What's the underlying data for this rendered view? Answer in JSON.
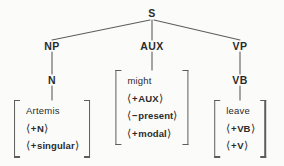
{
  "figure": {
    "type": "syntax-tree",
    "title": "",
    "background_color": "#fbfbfa",
    "line_color": "#5d5d5d",
    "text_color": "#2b2b2b"
  },
  "tree": {
    "root": {
      "label": "S",
      "x": 152,
      "y": 13
    },
    "level2": [
      {
        "label": "NP",
        "x": 52,
        "y": 46
      },
      {
        "label": "AUX",
        "x": 152,
        "y": 46
      },
      {
        "label": "VP",
        "x": 240,
        "y": 46
      }
    ],
    "level3": [
      {
        "label": "N",
        "x": 52,
        "y": 80
      },
      {
        "label": "VB",
        "x": 240,
        "y": 80
      }
    ]
  },
  "matrices": [
    {
      "id": "np-matrix",
      "parent": "N",
      "x": 52,
      "y": 100,
      "rows": [
        {
          "kind": "word",
          "text": "Artemis"
        },
        {
          "kind": "feature",
          "sign": "+",
          "feature": "N"
        },
        {
          "kind": "feature",
          "sign": "+",
          "feature": "singular"
        }
      ]
    },
    {
      "id": "aux-matrix",
      "parent": "AUX",
      "x": 152,
      "y": 70,
      "rows": [
        {
          "kind": "word",
          "text": "might"
        },
        {
          "kind": "feature",
          "sign": "+",
          "feature": "AUX"
        },
        {
          "kind": "feature",
          "sign": "−",
          "feature": "present"
        },
        {
          "kind": "feature",
          "sign": "+",
          "feature": "modal"
        }
      ]
    },
    {
      "id": "vp-matrix",
      "parent": "VB",
      "x": 240,
      "y": 100,
      "rows": [
        {
          "kind": "word",
          "text": "leave"
        },
        {
          "kind": "feature",
          "sign": "+",
          "feature": "VB"
        },
        {
          "kind": "feature",
          "sign": "+",
          "feature": "V"
        }
      ]
    }
  ],
  "brackets": {
    "open": "⟨",
    "close": "⟩"
  }
}
